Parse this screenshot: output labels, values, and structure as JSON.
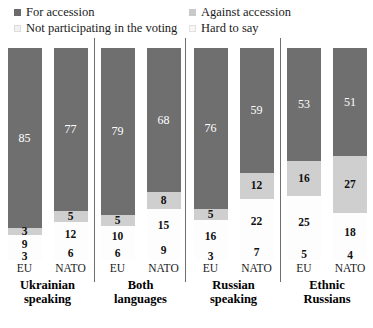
{
  "legend": {
    "items": [
      {
        "label": "For accession",
        "key": "for",
        "color": "#6f6f6f"
      },
      {
        "label": "Against accession",
        "key": "against",
        "color": "#cfcfcf"
      },
      {
        "label": "Not participating in the voting",
        "key": "not_participating",
        "color": "#fdfdfd"
      },
      {
        "label": "Hard to say",
        "key": "hard_to_say",
        "color": "#fdfdfd"
      }
    ]
  },
  "chart_data": {
    "type": "bar",
    "subtype": "100% stacked column",
    "title": "",
    "xlabel": "",
    "ylabel": "",
    "ylim": [
      0,
      100
    ],
    "grid": false,
    "legend_position": "top",
    "series": [
      {
        "name": "For accession",
        "color": "#6f6f6f",
        "values": [
          85,
          77,
          79,
          68,
          76,
          59,
          53,
          51
        ]
      },
      {
        "name": "Against accession",
        "color": "#cfcfcf",
        "values": [
          3,
          5,
          5,
          8,
          5,
          12,
          16,
          27
        ]
      },
      {
        "name": "Not participating in the voting",
        "color": "#fdfdfd",
        "values": [
          9,
          12,
          10,
          15,
          16,
          22,
          25,
          18
        ]
      },
      {
        "name": "Hard to say",
        "color": "#fdfdfd",
        "values": [
          3,
          6,
          6,
          9,
          3,
          7,
          5,
          4
        ]
      }
    ],
    "categories": [
      "EU",
      "NATO",
      "EU",
      "NATO",
      "EU",
      "NATO",
      "EU",
      "NATO"
    ],
    "groups": [
      {
        "label_line1": "Ukrainian",
        "label_line2": "speaking",
        "bars": [
          {
            "tick": "EU",
            "for": 85,
            "against": 3,
            "not_participating": 9,
            "hard_to_say": 3
          },
          {
            "tick": "NATO",
            "for": 77,
            "against": 5,
            "not_participating": 12,
            "hard_to_say": 6
          }
        ]
      },
      {
        "label_line1": "Both",
        "label_line2": "languages",
        "bars": [
          {
            "tick": "EU",
            "for": 79,
            "against": 5,
            "not_participating": 10,
            "hard_to_say": 6
          },
          {
            "tick": "NATO",
            "for": 68,
            "against": 8,
            "not_participating": 15,
            "hard_to_say": 9
          }
        ]
      },
      {
        "label_line1": "Russian",
        "label_line2": "speaking",
        "bars": [
          {
            "tick": "EU",
            "for": 76,
            "against": 5,
            "not_participating": 16,
            "hard_to_say": 3
          },
          {
            "tick": "NATO",
            "for": 59,
            "against": 12,
            "not_participating": 22,
            "hard_to_say": 7
          }
        ]
      },
      {
        "label_line1": "Ethnic",
        "label_line2": "Russians",
        "bars": [
          {
            "tick": "EU",
            "for": 53,
            "against": 16,
            "not_participating": 25,
            "hard_to_say": 5
          },
          {
            "tick": "NATO",
            "for": 51,
            "against": 27,
            "not_participating": 18,
            "hard_to_say": 4
          }
        ]
      }
    ]
  }
}
